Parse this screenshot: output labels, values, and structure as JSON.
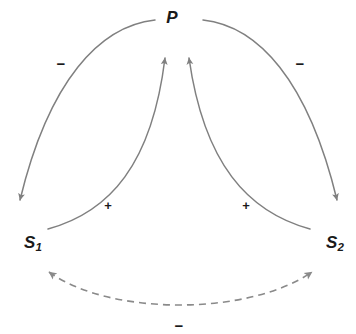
{
  "diagram": {
    "type": "signed-interaction-graph",
    "canvas": {
      "width": 356,
      "height": 334
    },
    "colors": {
      "stroke": "#808080",
      "dashed_stroke": "#8a8a8a",
      "label_text": "#1a1a1a",
      "background": "#ffffff"
    },
    "nodes": [
      {
        "id": "P",
        "label": "P",
        "subscript": "",
        "x": 172,
        "y": 18
      },
      {
        "id": "S1",
        "label": "S",
        "subscript": "1",
        "x": 33,
        "y": 242
      },
      {
        "id": "S2",
        "label": "S",
        "subscript": "2",
        "x": 335,
        "y": 242
      }
    ],
    "edges": [
      {
        "id": "P-to-S1",
        "from": "P",
        "to": "S1",
        "sign": "−",
        "style": "solid",
        "arrowheads": "single",
        "sign_label_id": "sign-left-minus"
      },
      {
        "id": "P-to-S2",
        "from": "P",
        "to": "S2",
        "sign": "−",
        "style": "solid",
        "arrowheads": "single",
        "sign_label_id": "sign-right-minus"
      },
      {
        "id": "S1-to-P",
        "from": "S1",
        "to": "P",
        "sign": "+",
        "style": "solid",
        "arrowheads": "single",
        "sign_label_id": "sign-left-plus"
      },
      {
        "id": "S2-to-P",
        "from": "S2",
        "to": "P",
        "sign": "+",
        "style": "solid",
        "arrowheads": "single",
        "sign_label_id": "sign-right-plus"
      },
      {
        "id": "S1-S2-mutual",
        "from": "S1",
        "to": "S2",
        "sign": "−",
        "style": "dashed",
        "arrowheads": "double",
        "sign_label_id": "sign-bottom-minus"
      }
    ],
    "signs": {
      "left_minus": "−",
      "right_minus": "−",
      "left_plus": "+",
      "right_plus": "+",
      "bottom_minus": "−"
    }
  }
}
